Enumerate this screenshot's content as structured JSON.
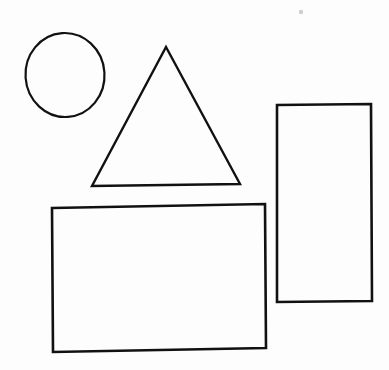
{
  "canvas": {
    "width": 389,
    "height": 370,
    "background_color": "#fdfdfd",
    "ink_color": "#111111",
    "title": "Hand-drawn geometric shapes",
    "description": "Scanned line drawing containing four outlined geometric shapes: a circle, a triangle, a wide rectangle and a tall rectangle.",
    "stroke_width": 2.2,
    "shape_count": "4"
  },
  "shapes": [
    {
      "id": "circle",
      "name": "circle",
      "label": "Circle",
      "kind": "ellipse",
      "fill": "none",
      "stroke": "#111111",
      "stroke_width": 2.2,
      "cx": 65,
      "cy": 75,
      "rx": 39.5,
      "ry": 42,
      "rotation": -4,
      "bounds": {
        "x": 25,
        "y": 33,
        "width": 79,
        "height": 84
      }
    },
    {
      "id": "triangle",
      "name": "triangle",
      "label": "Triangle",
      "kind": "polygon",
      "fill": "none",
      "stroke": "#111111",
      "stroke_width": 2.4,
      "points": "166,47 240,184 92,186",
      "vertices": [
        {
          "x": 166,
          "y": 47
        },
        {
          "x": 240,
          "y": 184
        },
        {
          "x": 92,
          "y": 186
        }
      ],
      "bounds": {
        "x": 92,
        "y": 47,
        "width": 148,
        "height": 139
      }
    },
    {
      "id": "wide-rectangle",
      "name": "wide-rectangle",
      "label": "Wide rectangle",
      "kind": "polygon",
      "fill": "none",
      "stroke": "#111111",
      "stroke_width": 2.6,
      "points": "52,208 265,204 266,348 53,352",
      "vertices": [
        {
          "x": 52,
          "y": 208
        },
        {
          "x": 265,
          "y": 204
        },
        {
          "x": 266,
          "y": 348
        },
        {
          "x": 53,
          "y": 352
        }
      ],
      "bounds": {
        "x": 52,
        "y": 204,
        "width": 214,
        "height": 148
      }
    },
    {
      "id": "tall-rectangle",
      "name": "tall-rectangle",
      "label": "Tall rectangle",
      "kind": "polygon",
      "fill": "none",
      "stroke": "#111111",
      "stroke_width": 2.6,
      "points": "277,105 371,104 372,301 277,302",
      "vertices": [
        {
          "x": 277,
          "y": 105
        },
        {
          "x": 371,
          "y": 104
        },
        {
          "x": 372,
          "y": 301
        },
        {
          "x": 277,
          "y": 302
        }
      ],
      "bounds": {
        "x": 277,
        "y": 104,
        "width": 95,
        "height": 198
      }
    }
  ],
  "artifacts": [
    {
      "id": "speck",
      "name": "scan-speck",
      "label": "Faint scan speck",
      "cx": 301,
      "cy": 12,
      "r": 2.2,
      "color": "#cfcfcf"
    }
  ]
}
